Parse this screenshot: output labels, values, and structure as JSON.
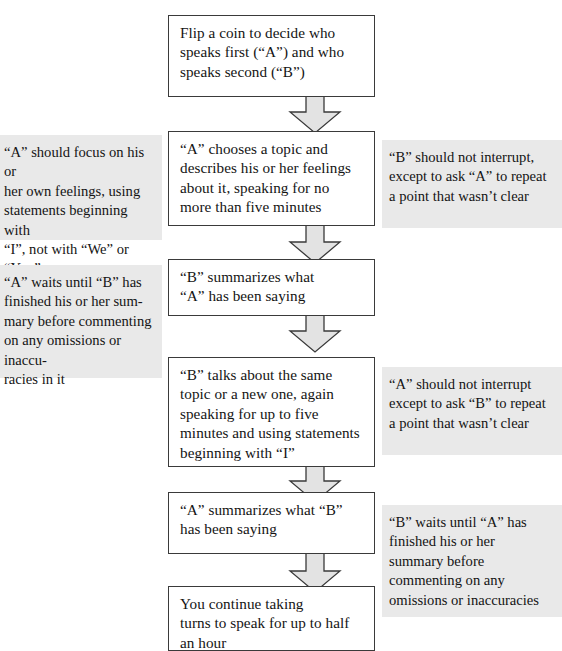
{
  "diagram": {
    "type": "flowchart",
    "colors": {
      "box_border": "#3a3a3a",
      "box_fill": "#ffffff",
      "arrow_fill": "#e3e3e3",
      "arrow_stroke": "#3a3a3a",
      "note_fill": "#e9e9e9",
      "text": "#141414"
    },
    "steps": [
      {
        "id": "step-1",
        "text": "Flip a coin to decide who\nspeaks first (“A”) and who\nspeaks second (“B”)"
      },
      {
        "id": "step-2",
        "text": "“A” chooses a topic and\ndescribes his or her feelings\nabout it, speaking for no\nmore than five minutes"
      },
      {
        "id": "step-3",
        "text": "“B” summarizes what\n“A” has been saying"
      },
      {
        "id": "step-4",
        "text": "“B” talks about the same\ntopic or a new one, again\nspeaking for up to five\nminutes and using statements\nbeginning with “I”"
      },
      {
        "id": "step-5",
        "text": "“A” summarizes what “B”\nhas been saying"
      },
      {
        "id": "step-6",
        "text": "You continue taking\nturns to speak for up to half\nan hour"
      }
    ],
    "notes_left": [
      {
        "id": "note-left-1",
        "text": "“A” should focus on his or\nher own feelings, using\nstatements beginning with\n“I”, not with “We” or “You”"
      },
      {
        "id": "note-left-2",
        "text": "“A” waits until “B” has\nfinished  his or her sum-\nmary before  commenting\non any omissions or inaccu-\nracies in it"
      }
    ],
    "notes_right": [
      {
        "id": "note-right-1",
        "text": "“B” should not interrupt,\nexcept to ask “A” to repeat\na point that wasn’t clear"
      },
      {
        "id": "note-right-2",
        "text": "“A” should not interrupt\nexcept  to ask “B” to repeat\na point that wasn’t clear"
      },
      {
        "id": "note-right-3",
        "text": "“B” waits until “A” has\nfinished  his or her\nsummary before\ncommenting on any\nomissions or inaccuracies"
      }
    ],
    "connectors": [
      {
        "id": "arrow-1",
        "from": "step-1",
        "to": "step-2"
      },
      {
        "id": "arrow-2",
        "from": "step-2",
        "to": "step-3"
      },
      {
        "id": "arrow-3",
        "from": "step-3",
        "to": "step-4"
      },
      {
        "id": "arrow-4",
        "from": "step-4",
        "to": "step-5"
      },
      {
        "id": "arrow-5",
        "from": "step-5",
        "to": "step-6"
      }
    ]
  }
}
